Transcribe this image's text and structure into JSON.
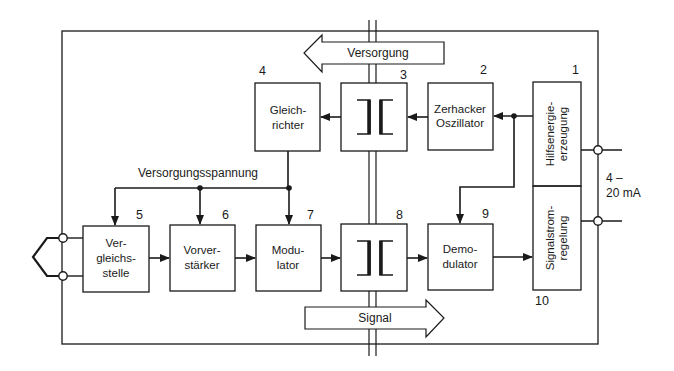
{
  "diagram": {
    "type": "block-diagram",
    "title": "",
    "colors": {
      "ink": "#1a1a1a",
      "background": "#ffffff"
    },
    "blocks": [
      {
        "id": "1",
        "number": "1",
        "lines": [
          "Hilfsenergie-",
          "erzeugung"
        ],
        "orientation": "vertical"
      },
      {
        "id": "2",
        "number": "2",
        "lines": [
          "Zerhacker",
          "Oszillator"
        ]
      },
      {
        "id": "3",
        "number": "3",
        "lines": [],
        "symbol": "coupling-transformer"
      },
      {
        "id": "4",
        "number": "4",
        "lines": [
          "Gleich-",
          "richter"
        ]
      },
      {
        "id": "5",
        "number": "5",
        "lines": [
          "Ver-",
          "gleichs-",
          "stelle"
        ]
      },
      {
        "id": "6",
        "number": "6",
        "lines": [
          "Vorver-",
          "stärker"
        ]
      },
      {
        "id": "7",
        "number": "7",
        "lines": [
          "Modu-",
          "lator"
        ]
      },
      {
        "id": "8",
        "number": "8",
        "lines": [],
        "symbol": "coupling-transformer"
      },
      {
        "id": "9",
        "number": "9",
        "lines": [
          "Demo-",
          "dulator"
        ]
      },
      {
        "id": "10",
        "number": "10",
        "lines": [
          "Signalstrom-",
          "regelung"
        ],
        "orientation": "vertical"
      }
    ],
    "labels": {
      "supply_voltage": "Versorgungsspannung",
      "supply_arrow": "Versorgung",
      "signal_arrow": "Signal",
      "current_range_line1": "4 –",
      "current_range_line2": "20 mA"
    },
    "connections": [
      {
        "from": "1",
        "to": "2"
      },
      {
        "from": "2",
        "to": "3"
      },
      {
        "from": "3",
        "to": "4"
      },
      {
        "from": "4",
        "to": "5",
        "via": "supply-bus"
      },
      {
        "from": "4",
        "to": "6",
        "via": "supply-bus"
      },
      {
        "from": "4",
        "to": "7",
        "via": "supply-bus"
      },
      {
        "from": "5",
        "to": "6"
      },
      {
        "from": "6",
        "to": "7"
      },
      {
        "from": "7",
        "to": "8"
      },
      {
        "from": "8",
        "to": "9"
      },
      {
        "from": "1",
        "to": "9"
      },
      {
        "from": "9",
        "to": "10"
      }
    ]
  }
}
